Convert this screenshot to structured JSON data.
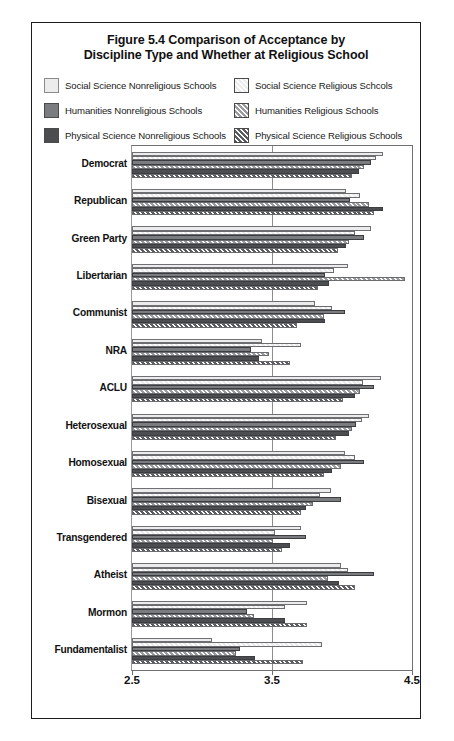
{
  "figure": {
    "title_line1": "Figure 5.4 Comparison of Acceptance by",
    "title_line2": "Discipline Type and Whether at Religious School"
  },
  "legend": {
    "items": [
      {
        "label": "Social Science Nonreligious Schools",
        "color": "#ececec",
        "hatched": false
      },
      {
        "label": "Social Science Religious Schcols",
        "color": "#ececec",
        "hatched": true
      },
      {
        "label": "Humanities Nonreligious Schools",
        "color": "#7b7c80",
        "hatched": false
      },
      {
        "label": "Humanities Religious Schools",
        "color": "#9a9b9f",
        "hatched": true
      },
      {
        "label": "Physical Science Nonreligious Schools",
        "color": "#4c4d51",
        "hatched": false
      },
      {
        "label": "Physical Science Religious Schools",
        "color": "#5b5c60",
        "hatched": true
      }
    ]
  },
  "chart_data": {
    "type": "bar",
    "orientation": "horizontal",
    "title": "Figure 5.4 Comparison of Acceptance by Discipline Type and Whether at Religious School",
    "xlabel": "",
    "ylabel": "",
    "xlim": [
      2.5,
      4.5
    ],
    "xticks": [
      2.5,
      3.5,
      4.5
    ],
    "xticklabels": [
      "2.5",
      "3.5",
      "4.5"
    ],
    "grid": false,
    "legend_position": "top",
    "categories": [
      "Democrat",
      "Republican",
      "Green Party",
      "Libertarian",
      "Communist",
      "NRA",
      "ACLU",
      "Heterosexual",
      "Homosexual",
      "Bisexual",
      "Transgendered",
      "Atheist",
      "Mormon",
      "Fundamentalist"
    ],
    "series": [
      {
        "name": "Social Science Nonreligious Schools",
        "values": [
          4.29,
          4.03,
          4.21,
          4.04,
          3.81,
          3.43,
          4.28,
          4.19,
          4.02,
          3.92,
          3.71,
          3.99,
          3.75,
          3.07
        ]
      },
      {
        "name": "Social Science Religious Schcols",
        "values": [
          4.24,
          4.13,
          4.09,
          3.94,
          3.93,
          3.71,
          4.15,
          4.14,
          4.09,
          3.84,
          3.52,
          4.04,
          3.59,
          3.86
        ]
      },
      {
        "name": "Humanities Nonreligious Schools",
        "values": [
          4.21,
          4.06,
          4.16,
          3.88,
          4.02,
          3.35,
          4.23,
          4.1,
          4.16,
          3.99,
          3.74,
          4.23,
          3.32,
          3.27
        ]
      },
      {
        "name": "Humanities Religious Schools",
        "values": [
          4.16,
          4.19,
          4.05,
          4.45,
          3.87,
          3.48,
          4.13,
          4.07,
          3.99,
          3.79,
          3.51,
          3.9,
          3.37,
          3.24
        ]
      },
      {
        "name": "Physical Science Nonreligious Schools",
        "values": [
          4.12,
          4.29,
          4.03,
          3.91,
          3.88,
          3.41,
          4.09,
          4.05,
          3.93,
          3.74,
          3.63,
          3.98,
          3.59,
          3.38
        ]
      },
      {
        "name": "Physical Science Religious Schools",
        "values": [
          4.07,
          4.23,
          3.97,
          3.83,
          3.68,
          3.63,
          4.01,
          3.96,
          3.87,
          3.71,
          3.57,
          4.09,
          3.75,
          3.72
        ]
      }
    ]
  }
}
